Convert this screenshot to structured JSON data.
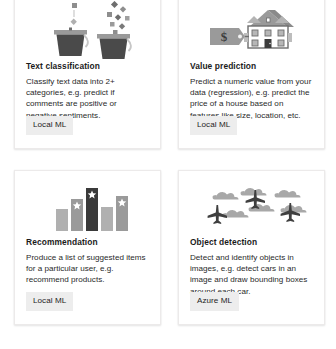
{
  "page": {
    "background_color": "#ffffff",
    "layout": "2x2 card grid",
    "card_background": "#ffffff",
    "card_border_color": "#eceaea",
    "badge_background": "#ededed",
    "text_color": "#2a2a2a",
    "title_color": "#1b1b1b",
    "icon_gray_light": "#b7b7b7",
    "icon_gray_mid": "#8e8e8e",
    "icon_gray_dark": "#4a4a4a",
    "icon_gray_darkest": "#3a3a3a"
  },
  "cards": [
    {
      "id": "text-classification",
      "icon": "two-buckets-sorting-icon",
      "title": "Text classification",
      "description": "Classify text data into 2+ categories, e.g. predict if comments are positive or negative sentiments.",
      "badge": "Local ML"
    },
    {
      "id": "value-prediction",
      "icon": "price-tag-house-icon",
      "icon_label": "$",
      "title": "Value prediction",
      "description": "Predict a numeric value from your data (regression), e.g. predict the price of a house based on features like size, location, etc.",
      "badge": "Local ML"
    },
    {
      "id": "recommendation",
      "icon": "bar-chart-stars-icon",
      "title": "Recommendation",
      "description": "Produce a list of suggested items for a particular user, e.g. recommend products.",
      "badge": "Local ML"
    },
    {
      "id": "object-detection",
      "icon": "planes-clouds-icon",
      "title": "Object detection",
      "description": "Detect and identify objects in images, e.g. detect cars in an image and draw bounding boxes around each car.",
      "badge": "Azure ML"
    }
  ]
}
